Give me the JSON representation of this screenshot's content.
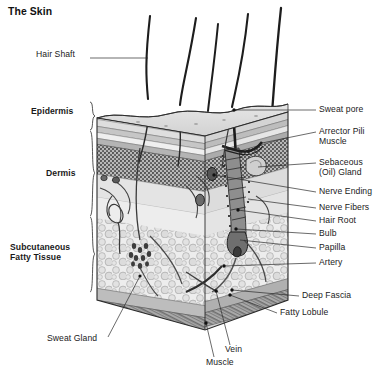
{
  "figure": {
    "title": "The Skin",
    "type": "anatomical-cross-section-diagram",
    "background_color": "#ffffff",
    "ink_color": "#1a1a1a",
    "style": "grayscale pen-and-ink / halftone shaded block diagram"
  },
  "layer_labels": [
    {
      "id": "epidermis",
      "text": "Epidermis",
      "side": "left",
      "bold": true,
      "x": 31,
      "y": 112,
      "brace": {
        "x": 86,
        "y1": 102,
        "y2": 130
      }
    },
    {
      "id": "dermis",
      "text": "Dermis",
      "side": "left",
      "bold": true,
      "x": 46,
      "y": 175,
      "brace": {
        "x": 86,
        "y1": 131,
        "y2": 216
      }
    },
    {
      "id": "subcutaneous",
      "text": "Subcutaneous",
      "side": "left",
      "bold": true,
      "x": 10,
      "y": 240,
      "brace": {
        "x": 86,
        "y1": 217,
        "y2": 292
      }
    },
    {
      "id": "subcutaneous2",
      "text": "Fatty Tissue",
      "side": "left",
      "bold": true,
      "x": 10,
      "y": 250,
      "brace": null
    }
  ],
  "callouts_left": [
    {
      "id": "hair-shaft",
      "text": "Hair Shaft",
      "x": 36,
      "y": 54,
      "leader": [
        [
          90,
          58
        ],
        [
          148,
          58
        ]
      ],
      "dot": false
    },
    {
      "id": "sweat-gland",
      "text": "Sweat Gland",
      "x": 47,
      "y": 340,
      "leader": [
        [
          108,
          337
        ],
        [
          140,
          276
        ]
      ],
      "dot": true
    }
  ],
  "callouts_right": [
    {
      "id": "sweat-pore",
      "text": "Sweat pore",
      "x": 319,
      "y": 107,
      "leader": [
        [
          316,
          110
        ],
        [
          232,
          110
        ]
      ],
      "dot": true,
      "line2": null
    },
    {
      "id": "arrector-pili",
      "text": "Arrector Pili",
      "x": 319,
      "y": 129,
      "leader": [
        [
          316,
          132
        ],
        [
          262,
          143
        ]
      ],
      "dot": false,
      "line2": "Muscle"
    },
    {
      "id": "sebaceous-gland",
      "text": "Sebaceous",
      "x": 319,
      "y": 160,
      "leader": [
        [
          316,
          163
        ],
        [
          256,
          168
        ]
      ],
      "dot": false,
      "line2": "(Oil) Gland"
    },
    {
      "id": "nerve-ending",
      "text": "Nerve Ending",
      "x": 319,
      "y": 189,
      "leader": [
        [
          316,
          192
        ],
        [
          214,
          176
        ]
      ],
      "dot": true,
      "line2": null
    },
    {
      "id": "nerve-fibers",
      "text": "Nerve Fibers",
      "x": 319,
      "y": 205,
      "leader": [
        [
          316,
          208
        ],
        [
          246,
          199
        ]
      ],
      "dot": false,
      "line2": null
    },
    {
      "id": "hair-root",
      "text": "Hair Root",
      "x": 319,
      "y": 218,
      "leader": [
        [
          316,
          221
        ],
        [
          238,
          210
        ]
      ],
      "dot": true,
      "line2": null
    },
    {
      "id": "bulb",
      "text": "Bulb",
      "x": 319,
      "y": 231,
      "leader": [
        [
          316,
          234
        ],
        [
          236,
          228
        ]
      ],
      "dot": true,
      "line2": null
    },
    {
      "id": "papilla",
      "text": "Papilla",
      "x": 319,
      "y": 245,
      "leader": [
        [
          316,
          248
        ],
        [
          240,
          238
        ]
      ],
      "dot": false,
      "line2": null
    },
    {
      "id": "artery",
      "text": "Artery",
      "x": 319,
      "y": 260,
      "leader": [
        [
          316,
          263
        ],
        [
          222,
          268
        ]
      ],
      "dot": true,
      "line2": null
    },
    {
      "id": "deep-fascia",
      "text": "Deep Fascia",
      "x": 302,
      "y": 293,
      "leader": [
        [
          299,
          296
        ],
        [
          232,
          290
        ]
      ],
      "dot": true,
      "line2": null
    },
    {
      "id": "fatty-lobule",
      "text": "Fatty Lobule",
      "x": 280,
      "y": 312,
      "leader": [
        [
          277,
          312
        ],
        [
          230,
          295
        ]
      ],
      "dot": true,
      "line2": null
    }
  ],
  "callouts_bottom": [
    {
      "id": "vein",
      "text": "Vein",
      "x": 225,
      "y": 350,
      "leader": [
        [
          232,
          344
        ],
        [
          218,
          292
        ]
      ],
      "dot": true
    },
    {
      "id": "muscle",
      "text": "Muscle",
      "x": 211,
      "y": 363,
      "leader": [
        [
          216,
          356
        ],
        [
          208,
          322
        ]
      ],
      "dot": true
    }
  ],
  "anatomy_features": [
    {
      "name": "hair-shaft-1",
      "type": "hair",
      "emerges_at": [
        148,
        98
      ]
    },
    {
      "name": "hair-shaft-2",
      "type": "hair",
      "emerges_at": [
        180,
        104
      ]
    },
    {
      "name": "hair-shaft-3",
      "type": "hair",
      "emerges_at": [
        208,
        110
      ]
    },
    {
      "name": "hair-shaft-4",
      "type": "hair",
      "emerges_at": [
        232,
        106
      ]
    },
    {
      "name": "hair-shaft-5",
      "type": "hair",
      "emerges_at": [
        272,
        112
      ]
    }
  ]
}
